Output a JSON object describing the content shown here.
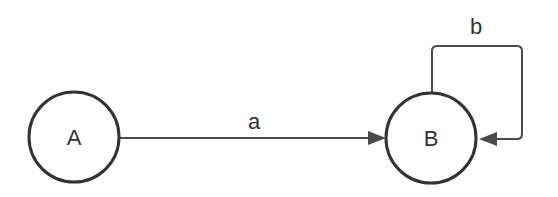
{
  "diagram": {
    "type": "state-transition",
    "colors": {
      "stroke": "#333333",
      "edge": "#4a4a4a",
      "background": "#ffffff"
    },
    "nodes": [
      {
        "id": "A",
        "label": "A",
        "cx": 74,
        "cy": 137,
        "r": 45
      },
      {
        "id": "B",
        "label": "B",
        "cx": 431,
        "cy": 138,
        "r": 45
      }
    ],
    "edges": [
      {
        "id": "a",
        "from": "A",
        "to": "B",
        "label": "a"
      },
      {
        "id": "b",
        "from": "B",
        "to": "B",
        "label": "b",
        "self_loop": true
      }
    ]
  }
}
